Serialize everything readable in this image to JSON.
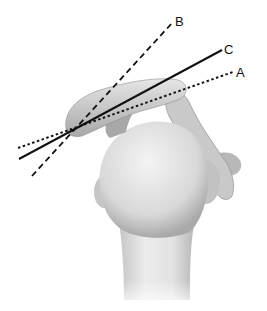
{
  "figure": {
    "lines": [
      {
        "label": "A",
        "style": "dotted",
        "x1": 18,
        "y1": 148,
        "x2": 233,
        "y2": 72
      },
      {
        "label": "B",
        "style": "dashed",
        "x1": 32,
        "y1": 176,
        "x2": 173,
        "y2": 22
      },
      {
        "label": "C",
        "style": "solid",
        "x1": 19,
        "y1": 159,
        "x2": 222,
        "y2": 50
      }
    ],
    "labels": {
      "a": "A",
      "b": "B",
      "c": "C"
    }
  }
}
